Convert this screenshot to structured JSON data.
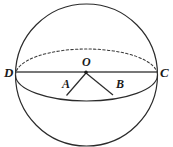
{
  "figure": {
    "kind": "sphere-with-central-angle",
    "background_color": "#ffffff",
    "stroke_color": "#2b2b2b",
    "equator_back_style": "dashed",
    "equator_front_style": "solid",
    "labels": {
      "left_endpoint": "D",
      "right_endpoint": "C",
      "center": "O",
      "left_radius_point": "A",
      "right_radius_point": "B"
    },
    "geometry": {
      "sphere_center_x": 86.5,
      "sphere_center_y": 75,
      "sphere_radius": 71,
      "diameter_line_y": 72,
      "diameter_left_x": 16,
      "diameter_right_x": 157,
      "equator_semi_minor": 26,
      "center_dot_x": 86,
      "center_dot_y": 72,
      "point_a_x": 66,
      "point_a_y": 95,
      "point_b_x": 113,
      "point_b_y": 95
    }
  }
}
